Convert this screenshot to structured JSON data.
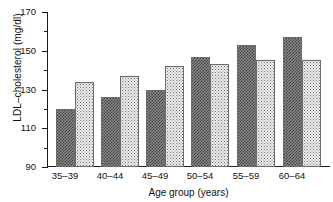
{
  "chart_data": {
    "type": "bar",
    "title": "",
    "xlabel": "Age group (years)",
    "ylabel": "LDL–cholesterol (mg/dl)",
    "categories": [
      "35–39",
      "40–44",
      "45–49",
      "50–54",
      "55–59",
      "60–64"
    ],
    "series": [
      {
        "name": "dark-series",
        "pattern": "dense-checker-dark-gray",
        "color": "#6a6a6a",
        "values": [
          120,
          126,
          130,
          147,
          153,
          157
        ]
      },
      {
        "name": "light-series",
        "pattern": "sparse-stipple-light-gray",
        "color": "#e6e6e6",
        "values": [
          134,
          137,
          142,
          143,
          145,
          145
        ]
      }
    ],
    "ylim": [
      90,
      170
    ],
    "ymajor_ticks": [
      90,
      110,
      130,
      150,
      170
    ],
    "yminor_ticks": [
      100,
      120,
      140,
      160
    ],
    "ytick_labels": [
      "90",
      "110",
      "130",
      "150",
      "170"
    ],
    "grid": false,
    "legend": "none",
    "legend_position": "none"
  }
}
